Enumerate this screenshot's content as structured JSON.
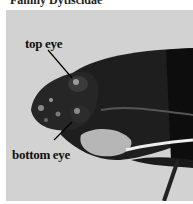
{
  "caption": "Family Dytiscidae",
  "photo": {
    "subject": "diving beetle head, side view",
    "background_color": "#d2d2d2",
    "labels": [
      {
        "id": "top",
        "text": "top eye"
      },
      {
        "id": "bottom",
        "text": "bottom eye"
      }
    ]
  }
}
